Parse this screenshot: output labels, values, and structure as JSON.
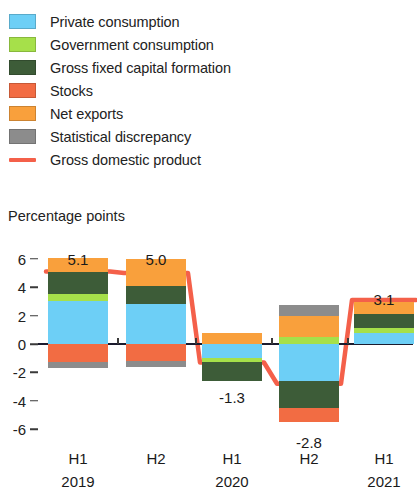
{
  "legend": {
    "items": [
      {
        "label": "Private consumption",
        "color": "#6dcff6",
        "type": "swatch",
        "key": "private_consumption"
      },
      {
        "label": "Government consumption",
        "color": "#a6e04a",
        "type": "swatch",
        "key": "government_consumption"
      },
      {
        "label": "Gross fixed capital formation",
        "color": "#3d5c38",
        "type": "swatch",
        "key": "gross_fixed_capital_formation"
      },
      {
        "label": "Stocks",
        "color": "#f26c43",
        "type": "swatch",
        "key": "stocks"
      },
      {
        "label": "Net exports",
        "color": "#f9a03c",
        "type": "swatch",
        "key": "net_exports"
      },
      {
        "label": "Statistical discrepancy",
        "color": "#8c8c8c",
        "type": "swatch",
        "key": "statistical_discrepancy"
      },
      {
        "label": "Gross domestic product",
        "color": "#f4604a",
        "type": "line",
        "key": "gross_domestic_product"
      }
    ]
  },
  "axis": {
    "unit_label": "Percentage points",
    "y_ticks": [
      "6",
      "4",
      "2",
      "0",
      "-2",
      "-4",
      "-6"
    ],
    "y_tick_values": [
      6,
      4,
      2,
      0,
      -2,
      -4,
      -6
    ]
  },
  "chart_data": {
    "type": "bar",
    "title": "",
    "subtitle": "",
    "xlabel": "",
    "ylabel": "Percentage points",
    "ylim": [
      -7.0,
      6.6
    ],
    "grid": false,
    "legend_position": "top",
    "stacked": true,
    "categories": [
      "H1",
      "H2",
      "H1",
      "H2",
      "H1"
    ],
    "group_labels": [
      "2019",
      "",
      "2020",
      "",
      "2021"
    ],
    "series": [
      {
        "name": "Private consumption",
        "color": "#6dcff6",
        "values": [
          3.0,
          2.8,
          -1.0,
          -2.6,
          0.75
        ]
      },
      {
        "name": "Government consumption",
        "color": "#a6e04a",
        "values": [
          0.5,
          0.0,
          -0.3,
          0.47,
          0.35
        ]
      },
      {
        "name": "Gross fixed capital formation",
        "color": "#3d5c38",
        "values": [
          1.55,
          1.3,
          -1.3,
          -1.9,
          1.0
        ]
      },
      {
        "name": "Stocks",
        "color": "#f26c43",
        "values": [
          -1.3,
          -1.2,
          0.0,
          -1.0,
          0.0
        ]
      },
      {
        "name": "Net exports",
        "color": "#f9a03c",
        "values": [
          1.0,
          1.9,
          0.77,
          1.48,
          0.83
        ]
      },
      {
        "name": "Statistical discrepancy",
        "color": "#8c8c8c",
        "values": [
          -0.4,
          -0.4,
          0.0,
          0.82,
          0.0
        ]
      }
    ],
    "line_series": {
      "name": "Gross domestic product",
      "color": "#f4604a",
      "values": [
        5.1,
        5.0,
        -1.3,
        -2.8,
        3.1
      ]
    },
    "data_labels": [
      "5.1",
      "5.0",
      "-1.3",
      "-2.8",
      "3.1"
    ]
  }
}
